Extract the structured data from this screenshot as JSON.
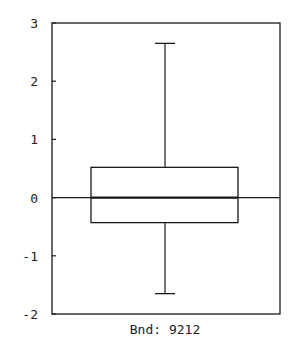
{
  "chart_data": {
    "type": "box",
    "title": "",
    "xlabel": "Bnd: 9212",
    "ylabel": "",
    "categories": [
      "Bnd: 9212"
    ],
    "ylim": [
      -2,
      3
    ],
    "yticks": [
      3,
      2,
      1,
      0,
      -1,
      -2
    ],
    "ytick_labels": [
      "3",
      "2",
      "1",
      "0",
      "-1",
      "-2"
    ],
    "grid": false,
    "reference_line": 0,
    "series": [
      {
        "name": "Bnd: 9212",
        "whisker_high": 2.65,
        "q3": 0.52,
        "median": 0.0,
        "q1": -0.43,
        "whisker_low": -1.65
      }
    ],
    "colors": {
      "line": "#1a1a1a",
      "background": "#ffffff"
    }
  }
}
